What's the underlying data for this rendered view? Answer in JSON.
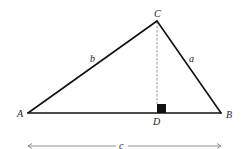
{
  "diagram": {
    "type": "geometry-triangle",
    "vertices": {
      "A": {
        "label": "A",
        "x": 28,
        "y": 113
      },
      "B": {
        "label": "B",
        "x": 221,
        "y": 113
      },
      "C": {
        "label": "C",
        "x": 157,
        "y": 21
      },
      "D": {
        "label": "D",
        "x": 157,
        "y": 113
      }
    },
    "sides": {
      "a": {
        "label": "a",
        "from": "C",
        "to": "B"
      },
      "b": {
        "label": "b",
        "from": "A",
        "to": "C"
      },
      "c": {
        "label": "c",
        "from": "A",
        "to": "B"
      }
    },
    "altitude": {
      "from": "C",
      "to": "D",
      "style": "dashed"
    },
    "right_angle_marker": {
      "at": "D",
      "style": "filled-square"
    },
    "dimension_arrow": {
      "label": "c",
      "x1": 27,
      "x2": 222,
      "y": 146
    },
    "colors": {
      "stroke": "#111111",
      "dashed": "#999999",
      "arrow": "#777777",
      "label": "#222222"
    }
  }
}
